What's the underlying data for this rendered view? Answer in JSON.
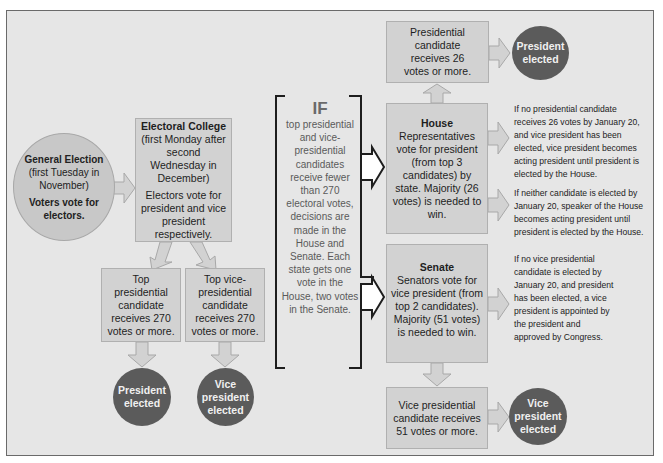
{
  "colors": {
    "frame_bg": "#e6e6e6",
    "box_bg": "#d2d2d2",
    "circle_dark": "#5b5b5b",
    "circle_light": "#c8c8c8",
    "bracket": "#1e1e1e"
  },
  "general_election": {
    "title": "General Election",
    "date": "(first Tuesday in November)",
    "action": "Voters vote for electors."
  },
  "electoral_college": {
    "title": "Electoral College",
    "date": "(first Monday after second Wednesday in December)",
    "action": "Electors vote for president and vice president respectively."
  },
  "top_president_box": "Top presidential candidate receives 270 votes or more.",
  "top_vp_box": "Top vice-presidential candidate receives 270 votes or more.",
  "president_elected_left": "President elected",
  "vp_elected_left": "Vice president elected",
  "condition": {
    "label": "IF",
    "text": "top presidential and vice-presidential candidates receive fewer than 270 electoral votes, decisions are made in the House and Senate. Each state gets one vote in the House, two votes in the Senate."
  },
  "house_win_box": "Presidential candidate receives 26 votes or more.",
  "president_elected_top": "President elected",
  "house": {
    "title": "House",
    "text": "Representatives vote for president (from top 3 candidates) by state. Majority (26 votes) is needed to win."
  },
  "senate": {
    "title": "Senate",
    "text": "Senators vote for vice president (from top 2 candidates). Majority (51 votes) is needed to win."
  },
  "senate_win_box": "Vice presidential candidate receives 51 votes or more.",
  "vp_elected_right": "Vice president elected",
  "notes": [
    "If no presidential candidate receives 26 votes by January 20, and vice president has been elected, vice president becomes acting president until president is elected by the House.",
    "If neither candidate is elected by January 20, speaker of the House becomes acting president until president is elected by the House.",
    "If no vice presidential candidate is elected by January 20, and president has been elected, a vice president is appointed by the president and approved by Congress."
  ]
}
